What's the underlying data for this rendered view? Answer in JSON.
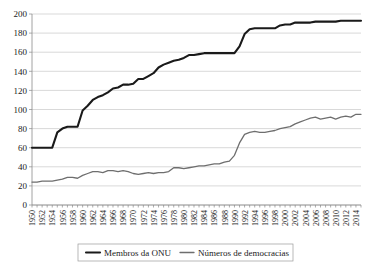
{
  "chart_data": {
    "type": "line",
    "title": "",
    "subtitle": "",
    "xlabel": "",
    "ylabel": "",
    "xlim": [
      1950,
      2015
    ],
    "ylim": [
      0,
      200
    ],
    "grid": true,
    "legend_position": "bottom",
    "y_ticks": [
      0,
      20,
      40,
      60,
      80,
      100,
      120,
      140,
      160,
      180,
      200
    ],
    "x_tick_labels": [
      "1950",
      "1952",
      "1954",
      "1956",
      "1958",
      "1960",
      "1962",
      "1964",
      "1966",
      "1968",
      "1970",
      "1972",
      "1974",
      "1976",
      "1978",
      "1980",
      "1982",
      "1984",
      "1986",
      "1988",
      "1990",
      "1992",
      "1994",
      "1996",
      "1998",
      "2000",
      "2002",
      "2004",
      "2006",
      "2008",
      "2010",
      "2012",
      "2014"
    ],
    "x": [
      1950,
      1951,
      1952,
      1953,
      1954,
      1955,
      1956,
      1957,
      1958,
      1959,
      1960,
      1961,
      1962,
      1963,
      1964,
      1965,
      1966,
      1967,
      1968,
      1969,
      1970,
      1971,
      1972,
      1973,
      1974,
      1975,
      1976,
      1977,
      1978,
      1979,
      1980,
      1981,
      1982,
      1983,
      1984,
      1985,
      1986,
      1987,
      1988,
      1989,
      1990,
      1991,
      1992,
      1993,
      1994,
      1995,
      1996,
      1997,
      1998,
      1999,
      2000,
      2001,
      2002,
      2003,
      2004,
      2005,
      2006,
      2007,
      2008,
      2009,
      2010,
      2011,
      2012,
      2013,
      2014,
      2015
    ],
    "series": [
      {
        "name": "Membros da ONU",
        "color": "#1a1a1a",
        "width": 2.1,
        "values": [
          60,
          60,
          60,
          60,
          60,
          76,
          80,
          82,
          82,
          82,
          99,
          104,
          110,
          113,
          115,
          118,
          122,
          123,
          126,
          126,
          127,
          132,
          132,
          135,
          138,
          144,
          147,
          149,
          151,
          152,
          154,
          157,
          157,
          158,
          159,
          159,
          159,
          159,
          159,
          159,
          159,
          166,
          179,
          184,
          185,
          185,
          185,
          185,
          185,
          188,
          189,
          189,
          191,
          191,
          191,
          191,
          192,
          192,
          192,
          192,
          192,
          193,
          193,
          193,
          193,
          193
        ]
      },
      {
        "name": "Números de democracias",
        "color": "#6e6e6e",
        "width": 1.3,
        "values": [
          24,
          24,
          25,
          25,
          25,
          26,
          27,
          29,
          29,
          28,
          31,
          33,
          35,
          35,
          34,
          36,
          36,
          35,
          36,
          35,
          33,
          32,
          33,
          34,
          33,
          34,
          34,
          35,
          39,
          39,
          38,
          39,
          40,
          41,
          41,
          42,
          43,
          43,
          45,
          46,
          52,
          65,
          74,
          76,
          77,
          76,
          76,
          77,
          78,
          80,
          81,
          82,
          85,
          87,
          89,
          91,
          92,
          90,
          91,
          92,
          90,
          92,
          93,
          92,
          95,
          95
        ]
      }
    ],
    "legend": [
      {
        "label": "Membros da ONU",
        "color": "#1a1a1a",
        "width": 2.1
      },
      {
        "label": "Números de democracias",
        "color": "#6e6e6e",
        "width": 1.3
      }
    ]
  }
}
